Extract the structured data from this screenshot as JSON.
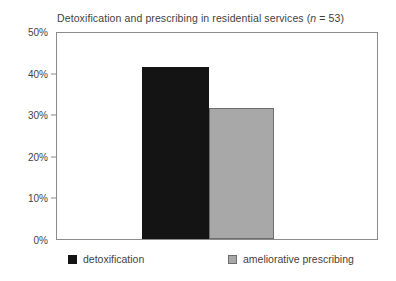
{
  "chart_data": {
    "type": "bar",
    "title": "Detoxification and prescribing in residential services (n = 53)",
    "title_prefix": "Detoxification and prescribing in residential services (",
    "title_italic": "n",
    "title_suffix": " = 53)",
    "categories": [
      "detoxification",
      "ameliorative prescribing"
    ],
    "values": [
      41.3,
      31.5
    ],
    "value_labels": [
      "41.3%",
      "31.5%"
    ],
    "xlabel": "",
    "ylabel": "",
    "ylim": [
      0,
      50
    ],
    "ytick_values": [
      50,
      40,
      30,
      20,
      10,
      0
    ],
    "ytick_labels": [
      "50%",
      "40%",
      "30%",
      "20%",
      "10%",
      "0%"
    ],
    "grid": false,
    "legend_position": "bottom",
    "series": [
      {
        "name": "detoxification",
        "value": 41.3,
        "color": "#141414"
      },
      {
        "name": "ameliorative prescribing",
        "value": 31.5,
        "color": "#a8a8a8"
      }
    ],
    "colors": {
      "series_0": "#141414",
      "series_1": "#a8a8a8",
      "axis": "#8c8c8c",
      "text": "#3f3f3f",
      "background": "#ffffff"
    }
  },
  "legend": {
    "entries": [
      {
        "label": "detoxification",
        "swatch": "black-square-swatch"
      },
      {
        "label": "ameliorative prescribing",
        "swatch": "gray-square-swatch"
      }
    ]
  }
}
